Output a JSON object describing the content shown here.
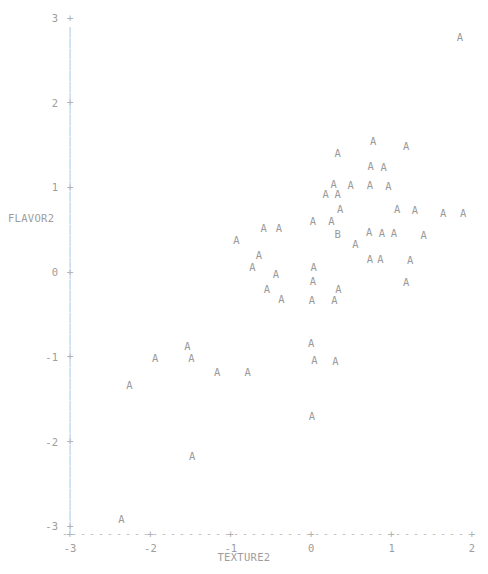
{
  "chart_data": {
    "type": "scatter",
    "title": "",
    "subtitle": "",
    "xlabel": "TEXTURE2",
    "ylabel": "FLAVOR2",
    "xlim": [
      -3,
      2
    ],
    "ylim": [
      -3,
      3
    ],
    "xticks": [
      -3,
      -2,
      -1,
      0,
      1,
      2
    ],
    "yticks": [
      3,
      2,
      1,
      0,
      -1,
      -2,
      -3
    ],
    "xtick_labels": [
      "-3",
      "-2",
      "-1",
      "0",
      "1",
      "2"
    ],
    "ytick_labels": [
      "3",
      "2",
      "1",
      "0",
      "-1",
      "-2",
      "-3"
    ],
    "grid": false,
    "legend": "none",
    "marker_color": "#9a9a9a",
    "axis_color": "#b9b9b9",
    "tick_label_color": "#9d9d9d",
    "background_color": "#ffffff",
    "axis_style": "dashed",
    "tick_glyph": "+",
    "series": [
      {
        "name": "A",
        "label": "A",
        "marker": "A",
        "points": [
          [
            1.85,
            2.78
          ],
          [
            0.77,
            1.55
          ],
          [
            1.18,
            1.49
          ],
          [
            0.33,
            1.41
          ],
          [
            0.74,
            1.25
          ],
          [
            0.9,
            1.24
          ],
          [
            0.28,
            1.04
          ],
          [
            0.49,
            1.03
          ],
          [
            0.73,
            1.03
          ],
          [
            0.96,
            1.02
          ],
          [
            0.18,
            0.92
          ],
          [
            0.33,
            0.92
          ],
          [
            0.36,
            0.75
          ],
          [
            1.07,
            0.74
          ],
          [
            1.29,
            0.73
          ],
          [
            1.64,
            0.7
          ],
          [
            1.89,
            0.7
          ],
          [
            0.02,
            0.6
          ],
          [
            0.25,
            0.6
          ],
          [
            -0.59,
            0.52
          ],
          [
            -0.4,
            0.52
          ],
          [
            0.72,
            0.47
          ],
          [
            0.88,
            0.46
          ],
          [
            1.03,
            0.46
          ],
          [
            1.4,
            0.44
          ],
          [
            -0.93,
            0.38
          ],
          [
            0.55,
            0.33
          ],
          [
            -0.65,
            0.2
          ],
          [
            0.73,
            0.16
          ],
          [
            0.86,
            0.16
          ],
          [
            1.23,
            0.14
          ],
          [
            -0.73,
            0.06
          ],
          [
            0.03,
            0.06
          ],
          [
            -0.44,
            -0.02
          ],
          [
            0.02,
            -0.1
          ],
          [
            1.18,
            -0.12
          ],
          [
            -0.55,
            -0.2
          ],
          [
            0.34,
            -0.2
          ],
          [
            -0.37,
            -0.32
          ],
          [
            0.01,
            -0.33
          ],
          [
            0.29,
            -0.33
          ],
          [
            -1.54,
            -0.87
          ],
          [
            0.0,
            -0.84
          ],
          [
            -1.94,
            -1.01
          ],
          [
            -1.49,
            -1.02
          ],
          [
            0.04,
            -1.04
          ],
          [
            0.3,
            -1.05
          ],
          [
            -1.17,
            -1.18
          ],
          [
            -0.79,
            -1.18
          ],
          [
            -2.26,
            -1.33
          ],
          [
            0.01,
            -1.7
          ],
          [
            -1.48,
            -2.17
          ],
          [
            -2.36,
            -2.92
          ]
        ]
      },
      {
        "name": "B",
        "label": "B",
        "marker": "B",
        "points": [
          [
            0.33,
            0.45
          ]
        ]
      }
    ]
  },
  "axes": {
    "y_axis_name": "y-axis",
    "x_axis_name": "x-axis"
  }
}
